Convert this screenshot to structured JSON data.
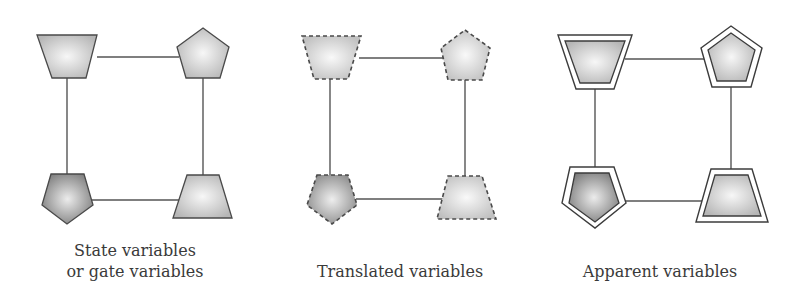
{
  "figure": {
    "panels": [
      {
        "id": "state",
        "caption_lines": [
          "State variables",
          "or gate variables"
        ],
        "border_style": "solid",
        "nodes": [
          {
            "shape": "trapezoid-inverted",
            "position": "top-left",
            "fill": "light"
          },
          {
            "shape": "pentagon",
            "position": "top-right",
            "fill": "light"
          },
          {
            "shape": "pentagon-inverted",
            "position": "bottom-left",
            "fill": "dark"
          },
          {
            "shape": "trapezoid",
            "position": "bottom-right",
            "fill": "light"
          }
        ]
      },
      {
        "id": "translated",
        "caption_lines": [
          "Translated variables"
        ],
        "border_style": "dashed",
        "nodes": [
          {
            "shape": "trapezoid-inverted",
            "position": "top-left",
            "fill": "light"
          },
          {
            "shape": "pentagon",
            "position": "top-right",
            "fill": "light"
          },
          {
            "shape": "pentagon-inverted",
            "position": "bottom-left",
            "fill": "dark"
          },
          {
            "shape": "trapezoid",
            "position": "bottom-right",
            "fill": "light"
          }
        ]
      },
      {
        "id": "apparent",
        "caption_lines": [
          "Apparent variables"
        ],
        "border_style": "double",
        "nodes": [
          {
            "shape": "trapezoid-inverted",
            "position": "top-left",
            "fill": "light"
          },
          {
            "shape": "pentagon",
            "position": "top-right",
            "fill": "light"
          },
          {
            "shape": "pentagon-inverted",
            "position": "bottom-left",
            "fill": "dark"
          },
          {
            "shape": "trapezoid",
            "position": "bottom-right",
            "fill": "light"
          }
        ]
      }
    ],
    "colors": {
      "light_fill_center": "#f4f4f4",
      "light_fill_edge": "#b8b8b8",
      "dark_fill_center": "#e6e6e6",
      "dark_fill_edge": "#7e7e7e",
      "stroke": "#4a4a4a",
      "edge": "#555555",
      "caption_text": "#3a3a3a"
    }
  }
}
